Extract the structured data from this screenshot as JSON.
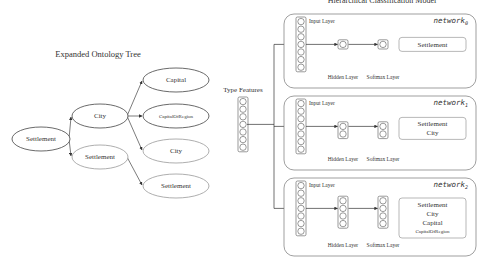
{
  "diagram": {
    "title": "Hierarchical Classification Model",
    "tree": {
      "title": "Expanded Ontology Tree",
      "nodes": [
        {
          "id": "root",
          "label": "Settlement",
          "cx": 41,
          "cy": 139,
          "rx": 29,
          "ry": 12,
          "stroke": "#444444",
          "size": 7
        },
        {
          "id": "city",
          "label": "City",
          "cx": 100,
          "cy": 116,
          "rx": 28,
          "ry": 12,
          "stroke": "#444444",
          "size": 7
        },
        {
          "id": "settlement2",
          "label": "Settlement",
          "cx": 100,
          "cy": 157,
          "rx": 28,
          "ry": 12,
          "stroke": "#999999",
          "size": 7
        },
        {
          "id": "capital",
          "label": "Capital",
          "cx": 176,
          "cy": 80,
          "rx": 33,
          "ry": 12,
          "stroke": "#444444",
          "size": 7
        },
        {
          "id": "capitalofregion",
          "label": "CapitalOfRegion",
          "cx": 176,
          "cy": 116,
          "rx": 33,
          "ry": 12,
          "stroke": "#444444",
          "size": 5
        },
        {
          "id": "city2",
          "label": "City",
          "cx": 176,
          "cy": 151,
          "rx": 33,
          "ry": 12,
          "stroke": "#999999",
          "size": 7
        },
        {
          "id": "settlement3",
          "label": "Settlement",
          "cx": 176,
          "cy": 186,
          "rx": 33,
          "ry": 12,
          "stroke": "#999999",
          "size": 7
        }
      ],
      "edges": [
        {
          "from": "root",
          "to": "city",
          "x1": 69,
          "y1": 139,
          "x2": 71,
          "y2": 117
        },
        {
          "from": "root",
          "to": "settlement2",
          "x1": 69,
          "y1": 139,
          "x2": 71,
          "y2": 156
        },
        {
          "from": "city",
          "to": "capital",
          "x1": 127,
          "y1": 116,
          "x2": 142,
          "y2": 81
        },
        {
          "from": "city",
          "to": "capitalofregion",
          "x1": 127,
          "y1": 116,
          "x2": 142,
          "y2": 116
        },
        {
          "from": "city",
          "to": "city2",
          "x1": 127,
          "y1": 116,
          "x2": 142,
          "y2": 150
        },
        {
          "from": "settlement2",
          "to": "settlement3",
          "x1": 127,
          "y1": 157,
          "x2": 142,
          "y2": 185
        }
      ]
    },
    "type_features": {
      "label": "Type Features",
      "neurons": 7
    },
    "networks": [
      {
        "name": "network",
        "subscript": "0",
        "box": {
          "x": 284,
          "y": 14,
          "w": 192,
          "h": 74
        },
        "input_label": "Input Layer",
        "hidden_label": "Hidden Layer",
        "softmax_label": "Softmax Layer",
        "input_neurons": 7,
        "hidden_neurons": 1,
        "softmax_neurons": 1,
        "classes": [
          "Settlement"
        ]
      },
      {
        "name": "network",
        "subscript": "1",
        "box": {
          "x": 284,
          "y": 96,
          "w": 192,
          "h": 74
        },
        "input_label": "Input Layer",
        "hidden_label": "Hidden Layer",
        "softmax_label": "Softmax Layer",
        "input_neurons": 7,
        "hidden_neurons": 2,
        "softmax_neurons": 2,
        "classes": [
          "Settlement",
          "City"
        ]
      },
      {
        "name": "network",
        "subscript": "2",
        "box": {
          "x": 284,
          "y": 178,
          "w": 192,
          "h": 78
        },
        "input_label": "Input Layer",
        "hidden_label": "Hidden Layer",
        "softmax_label": "Softmax Layer",
        "input_neurons": 7,
        "hidden_neurons": 4,
        "softmax_neurons": 4,
        "classes": [
          "Settlement",
          "City",
          "Capital",
          "CapitalOfRegion"
        ]
      }
    ],
    "colors": {
      "stroke_dark": "#444444",
      "stroke_light": "#999999",
      "text": "#333333"
    }
  }
}
